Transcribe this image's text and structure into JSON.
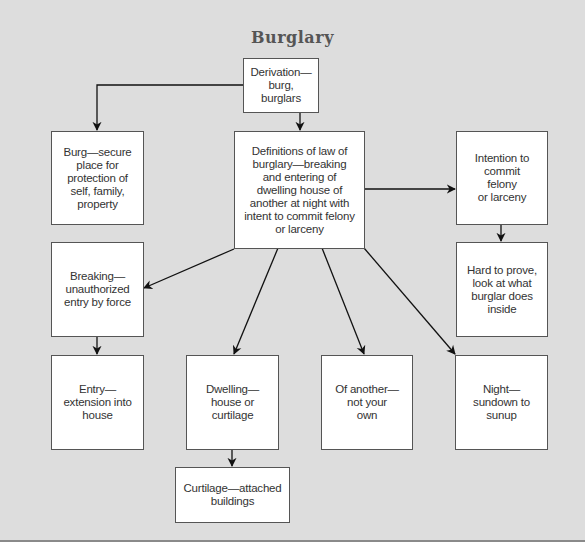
{
  "diagram": {
    "title": "Burglary",
    "nodes": {
      "derivation": "Derivation—burg,\nburglars",
      "burg": "Burg—secure\nplace for\nprotection of\nself, family,\nproperty",
      "definitions": "Definitions of law of\nburglary—breaking\nand entering of\ndwelling house of\nanother at night with\nintent to commit felony\nor larceny",
      "intention": "Intention to\ncommit\nfelony\nor larceny",
      "hard_to_prove": "Hard to prove,\nlook at what\nburglar does\ninside",
      "breaking": "Breaking—\nunauthorized\nentry by force",
      "entry": "Entry—\nextension into\nhouse",
      "dwelling": "Dwelling—\nhouse or\ncurtilage",
      "of_another": "Of another—\nnot your\nown",
      "night": "Night—\nsundown to\nsunup",
      "curtilage": "Curtilage—attached\nbuildings"
    },
    "edges": [
      {
        "from": "derivation",
        "to": "burg"
      },
      {
        "from": "derivation",
        "to": "definitions"
      },
      {
        "from": "definitions",
        "to": "intention"
      },
      {
        "from": "intention",
        "to": "hard_to_prove"
      },
      {
        "from": "definitions",
        "to": "breaking"
      },
      {
        "from": "breaking",
        "to": "entry"
      },
      {
        "from": "definitions",
        "to": "dwelling"
      },
      {
        "from": "dwelling",
        "to": "curtilage"
      },
      {
        "from": "definitions",
        "to": "of_another"
      },
      {
        "from": "definitions",
        "to": "night"
      }
    ],
    "colors": {
      "background": "#dddddd",
      "box_fill": "#ffffff",
      "box_border": "#555555",
      "text": "#333333",
      "arrow": "#111111"
    }
  }
}
